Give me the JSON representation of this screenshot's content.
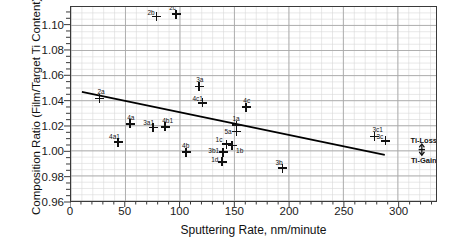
{
  "chart_data": {
    "type": "scatter",
    "title": "",
    "xlabel": "Sputtering Rate, nm/minute",
    "ylabel": "Composition Ratio (Film/Target Ti Content)",
    "xlim": [
      0,
      335
    ],
    "ylim": [
      0.96,
      1.1147
    ],
    "xticks": [
      0,
      50,
      100,
      150,
      200,
      250,
      300
    ],
    "xtick_labels": [
      "0",
      "50",
      "100",
      "150",
      "200",
      "250",
      "300"
    ],
    "yticks": [
      0.96,
      0.98,
      1.0,
      1.02,
      1.04,
      1.06,
      1.08,
      1.1
    ],
    "ytick_labels": [
      "0.96",
      "0.98",
      "1.00",
      "1.02",
      "1.04",
      "1.06",
      "1.08",
      "1.10"
    ],
    "x_minor_step": 10,
    "y_minor_step": 0.005,
    "grid": true,
    "legend": null,
    "marker": "plus",
    "points": [
      {
        "label": "2a",
        "x": 26,
        "y": 1.0425,
        "lx": -2,
        "ly": -10
      },
      {
        "label": "2b",
        "x": 78,
        "y": 1.1072,
        "lx": -9,
        "ly": -8
      },
      {
        "label": "2c",
        "x": 96,
        "y": 1.109,
        "lx": -7,
        "ly": -10
      },
      {
        "label": "4a1",
        "x": 43,
        "y": 1.008,
        "lx": -9,
        "ly": -9
      },
      {
        "label": "4a",
        "x": 54,
        "y": 1.0225,
        "lx": -3,
        "ly": -10
      },
      {
        "label": "3a1",
        "x": 75,
        "y": 1.0195,
        "lx": -10,
        "ly": -9
      },
      {
        "label": "4b1",
        "x": 86,
        "y": 1.02,
        "lx": -3,
        "ly": -10
      },
      {
        "label": "3a",
        "x": 117,
        "y": 1.052,
        "lx": -3,
        "ly": -10
      },
      {
        "label": "4c1",
        "x": 120,
        "y": 1.039,
        "lx": -10,
        "ly": -8
      },
      {
        "label": "4b",
        "x": 105,
        "y": 1.0,
        "lx": -4,
        "ly": -10
      },
      {
        "label": "4c",
        "x": 160,
        "y": 1.0355,
        "lx": -3,
        "ly": -10
      },
      {
        "label": "1a",
        "x": 151,
        "y": 1.0215,
        "lx": -4,
        "ly": -10
      },
      {
        "label": "5a",
        "x": 151,
        "y": 1.0163,
        "lx": -12,
        "ly": -4
      },
      {
        "label": "1c",
        "x": 142,
        "y": 1.0063,
        "lx": -11,
        "ly": -8
      },
      {
        "label": "1b",
        "x": 147,
        "y": 1.0052,
        "lx": 4,
        "ly": 1
      },
      {
        "label": "3b1",
        "x": 139,
        "y": 1.0,
        "lx": -15,
        "ly": -5
      },
      {
        "label": "1d",
        "x": 138,
        "y": 0.9925,
        "lx": -11,
        "ly": -6
      },
      {
        "label": "3b",
        "x": 193,
        "y": 0.9875,
        "lx": -7,
        "ly": -9
      },
      {
        "label": "3c1",
        "x": 277,
        "y": 1.0125,
        "lx": -2,
        "ly": -10
      },
      {
        "label": "3c",
        "x": 287,
        "y": 1.009,
        "lx": -9,
        "ly": -8
      }
    ],
    "trendline": {
      "x0": 10,
      "y0": 1.047,
      "x1": 288,
      "y1": 0.9968
    },
    "annotations": [
      {
        "label": "Ti-Loss",
        "x": 322,
        "y": 1.009,
        "role": "upper-label"
      },
      {
        "label": "Ti-Gain",
        "x": 322,
        "y": 0.993,
        "role": "lower-label"
      }
    ],
    "annotation_marker": {
      "x": 322,
      "y_top": 1.0055,
      "y_bottom": 0.9965,
      "style": "double-arrow-vertical"
    }
  },
  "colors": {
    "axis": "#3a3a3a",
    "grid_major": "#a8a8a8",
    "grid_minor": "#d8d8d8",
    "marker": "#111111",
    "trendline": "#000000",
    "text": "#111111",
    "background": "#ffffff"
  }
}
